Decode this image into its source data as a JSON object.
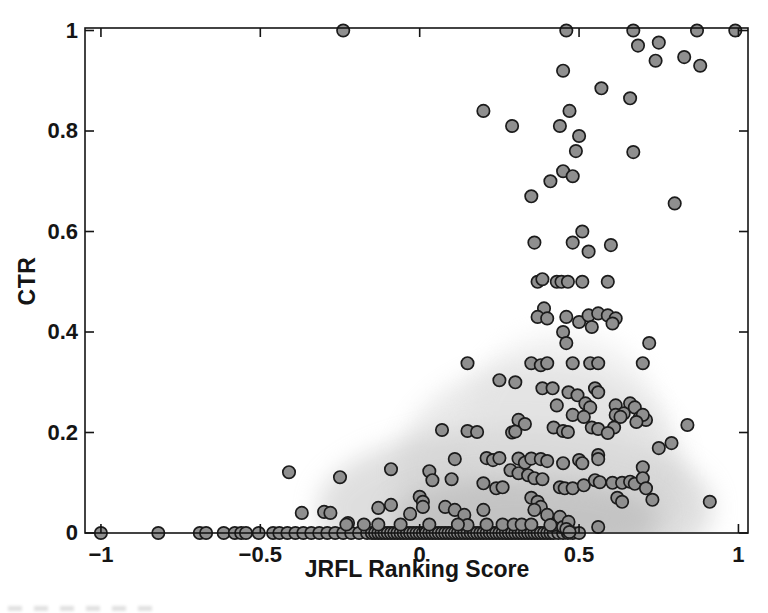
{
  "chart_data": {
    "type": "scatter",
    "title": "",
    "xlabel": "JRFL Ranking Score",
    "ylabel": "CTR",
    "xlim": [
      -1.05,
      1.03
    ],
    "ylim": [
      0,
      1.005
    ],
    "grid": false,
    "x_ticks": [
      -1,
      -0.5,
      0,
      0.5,
      1
    ],
    "x_tick_labels": [
      "−1",
      "−0.5",
      "0",
      "0.5",
      "1"
    ],
    "y_ticks": [
      0,
      0.2,
      0.4,
      0.6,
      0.8,
      1
    ],
    "y_tick_labels": [
      "0",
      "0.2",
      "0.4",
      "0.6",
      "0.8",
      "1"
    ],
    "marker": {
      "shape": "circle",
      "fill": "#8f8f8f",
      "edge": "#1b1b1b",
      "radius_px": 6.2
    },
    "axis_color": "#141414",
    "background_cloud": [
      {
        "cx": 0.3,
        "cy": 0.05,
        "rx": 0.62,
        "ry": 0.16,
        "color": "#bfbfbf",
        "opacity": 0.5
      },
      {
        "cx": 0.38,
        "cy": 0.12,
        "rx": 0.45,
        "ry": 0.22,
        "color": "#cfcfcf",
        "opacity": 0.45
      },
      {
        "cx": 0.45,
        "cy": 0.22,
        "rx": 0.3,
        "ry": 0.18,
        "color": "#dedede",
        "opacity": 0.4
      },
      {
        "cx": 0.33,
        "cy": 0.03,
        "rx": 0.42,
        "ry": 0.08,
        "color": "#b0b0b0",
        "opacity": 0.5
      }
    ],
    "points": [
      [
        -0.24,
        1
      ],
      [
        0.46,
        1
      ],
      [
        0.67,
        1
      ],
      [
        0.87,
        1
      ],
      [
        0.99,
        1
      ],
      [
        0.685,
        0.97
      ],
      [
        0.75,
        0.976
      ],
      [
        0.74,
        0.94
      ],
      [
        0.83,
        0.947
      ],
      [
        0.88,
        0.93
      ],
      [
        0.45,
        0.92
      ],
      [
        0.57,
        0.885
      ],
      [
        0.66,
        0.865
      ],
      [
        0.2,
        0.84
      ],
      [
        0.47,
        0.84
      ],
      [
        0.29,
        0.81
      ],
      [
        0.44,
        0.81
      ],
      [
        0.5,
        0.79
      ],
      [
        0.49,
        0.76
      ],
      [
        0.67,
        0.758
      ],
      [
        0.45,
        0.72
      ],
      [
        0.48,
        0.71
      ],
      [
        0.41,
        0.7
      ],
      [
        0.35,
        0.67
      ],
      [
        0.8,
        0.656
      ],
      [
        0.51,
        0.6
      ],
      [
        0.48,
        0.578
      ],
      [
        0.6,
        0.573
      ],
      [
        0.36,
        0.578
      ],
      [
        0.53,
        0.56
      ],
      [
        0.37,
        0.5
      ],
      [
        0.385,
        0.505
      ],
      [
        0.43,
        0.5
      ],
      [
        0.445,
        0.5
      ],
      [
        0.465,
        0.5
      ],
      [
        0.51,
        0.5
      ],
      [
        0.59,
        0.5
      ],
      [
        0.39,
        0.447
      ],
      [
        0.37,
        0.43
      ],
      [
        0.4,
        0.427
      ],
      [
        0.46,
        0.43
      ],
      [
        0.5,
        0.42
      ],
      [
        0.53,
        0.433
      ],
      [
        0.56,
        0.437
      ],
      [
        0.59,
        0.433
      ],
      [
        0.615,
        0.427
      ],
      [
        0.605,
        0.417
      ],
      [
        0.54,
        0.41
      ],
      [
        0.45,
        0.4
      ],
      [
        0.46,
        0.378
      ],
      [
        0.72,
        0.378
      ],
      [
        0.15,
        0.338
      ],
      [
        0.35,
        0.338
      ],
      [
        0.38,
        0.334
      ],
      [
        0.4,
        0.338
      ],
      [
        0.48,
        0.338
      ],
      [
        0.535,
        0.338
      ],
      [
        0.56,
        0.338
      ],
      [
        0.7,
        0.338
      ],
      [
        0.25,
        0.304
      ],
      [
        0.3,
        0.3
      ],
      [
        0.385,
        0.288
      ],
      [
        0.417,
        0.288
      ],
      [
        0.467,
        0.28
      ],
      [
        0.495,
        0.274
      ],
      [
        0.55,
        0.288
      ],
      [
        0.56,
        0.28
      ],
      [
        0.43,
        0.254
      ],
      [
        0.52,
        0.258
      ],
      [
        0.535,
        0.25
      ],
      [
        0.615,
        0.254
      ],
      [
        0.66,
        0.258
      ],
      [
        0.675,
        0.25
      ],
      [
        0.64,
        0.238
      ],
      [
        0.48,
        0.235
      ],
      [
        0.515,
        0.231
      ],
      [
        0.615,
        0.235
      ],
      [
        0.63,
        0.231
      ],
      [
        0.69,
        0.229
      ],
      [
        0.71,
        0.225
      ],
      [
        0.7,
        0.235
      ],
      [
        0.31,
        0.225
      ],
      [
        0.33,
        0.217
      ],
      [
        0.68,
        0.221
      ],
      [
        0.07,
        0.205
      ],
      [
        0.15,
        0.203
      ],
      [
        0.18,
        0.201
      ],
      [
        0.29,
        0.2
      ],
      [
        0.3,
        0.202
      ],
      [
        0.42,
        0.21
      ],
      [
        0.45,
        0.203
      ],
      [
        0.465,
        0.201
      ],
      [
        0.54,
        0.21
      ],
      [
        0.56,
        0.207
      ],
      [
        0.61,
        0.21
      ],
      [
        0.59,
        0.199
      ],
      [
        0.84,
        0.215
      ],
      [
        0.79,
        0.179
      ],
      [
        0.75,
        0.169
      ],
      [
        0.56,
        0.155
      ],
      [
        0.11,
        0.147
      ],
      [
        0.21,
        0.149
      ],
      [
        0.23,
        0.145
      ],
      [
        0.25,
        0.149
      ],
      [
        0.31,
        0.148
      ],
      [
        0.33,
        0.14
      ],
      [
        0.35,
        0.148
      ],
      [
        0.38,
        0.147
      ],
      [
        0.4,
        0.143
      ],
      [
        0.45,
        0.139
      ],
      [
        0.5,
        0.145
      ],
      [
        0.51,
        0.139
      ],
      [
        0.56,
        0.147
      ],
      [
        -0.41,
        0.121
      ],
      [
        -0.25,
        0.111
      ],
      [
        -0.09,
        0.127
      ],
      [
        0.03,
        0.123
      ],
      [
        0.285,
        0.125
      ],
      [
        0.31,
        0.119
      ],
      [
        0.34,
        0.115
      ],
      [
        0.36,
        0.109
      ],
      [
        0.385,
        0.107
      ],
      [
        0.7,
        0.131
      ],
      [
        0.04,
        0.105
      ],
      [
        0.1,
        0.107
      ],
      [
        0.2,
        0.099
      ],
      [
        0.24,
        0.089
      ],
      [
        0.26,
        0.091
      ],
      [
        0.44,
        0.091
      ],
      [
        0.455,
        0.089
      ],
      [
        0.48,
        0.089
      ],
      [
        0.515,
        0.095
      ],
      [
        0.55,
        0.105
      ],
      [
        0.565,
        0.101
      ],
      [
        0.605,
        0.1
      ],
      [
        0.635,
        0.1
      ],
      [
        0.66,
        0.102
      ],
      [
        0.675,
        0.098
      ],
      [
        0.7,
        0.109
      ],
      [
        0.71,
        0.089
      ],
      [
        0.91,
        0.062
      ],
      [
        0,
        0.072
      ],
      [
        0.01,
        0.062
      ],
      [
        0.01,
        0.052
      ],
      [
        0.35,
        0.07
      ],
      [
        0.37,
        0.062
      ],
      [
        0.38,
        0.052
      ],
      [
        0.36,
        0.046
      ],
      [
        0.62,
        0.07
      ],
      [
        0.635,
        0.062
      ],
      [
        0.73,
        0.066
      ],
      [
        -0.37,
        0.04
      ],
      [
        -0.3,
        0.042
      ],
      [
        -0.28,
        0.04
      ],
      [
        -0.13,
        0.05
      ],
      [
        -0.09,
        0.056
      ],
      [
        -0.03,
        0.038
      ],
      [
        0.08,
        0.052
      ],
      [
        0.11,
        0.046
      ],
      [
        0.14,
        0.036
      ],
      [
        0.2,
        0.046
      ],
      [
        0.4,
        0.036
      ],
      [
        0.42,
        0.016
      ],
      [
        0.44,
        0.032
      ],
      [
        0.45,
        0.012
      ],
      [
        0.467,
        0.022
      ],
      [
        0.56,
        0.012
      ],
      [
        -0.225,
        0.02
      ],
      [
        0.41,
        0.016
      ],
      [
        0.46,
        0.008
      ],
      [
        0.47,
        0.002
      ],
      [
        0.15,
        0.016
      ],
      [
        -0.23,
        0.017
      ],
      [
        -0.175,
        0.017
      ],
      [
        -0.13,
        0.017
      ],
      [
        -0.06,
        0.017
      ],
      [
        0.03,
        0.017
      ],
      [
        0.12,
        0.017
      ],
      [
        0.21,
        0.017
      ],
      [
        0.26,
        0.017
      ],
      [
        0.295,
        0.017
      ],
      [
        0.32,
        0.017
      ],
      [
        0.35,
        0.017
      ]
    ],
    "baseline_x": [
      -1,
      -0.82,
      -0.69,
      -0.67,
      -0.615,
      -0.58,
      -0.56,
      -0.545,
      -0.505,
      -0.46,
      -0.44,
      -0.415,
      -0.39,
      -0.365,
      -0.34,
      -0.315,
      -0.29,
      -0.265,
      -0.24,
      -0.215,
      -0.19,
      -0.165,
      -0.15,
      -0.14,
      -0.13,
      -0.12,
      -0.11,
      -0.1,
      -0.09,
      -0.08,
      -0.07,
      -0.06,
      -0.05,
      -0.04,
      -0.03,
      -0.02,
      -0.01,
      0,
      0.01,
      0.02,
      0.03,
      0.04,
      0.05,
      0.06,
      0.07,
      0.08,
      0.09,
      0.1,
      0.11,
      0.12,
      0.13,
      0.14,
      0.15,
      0.16,
      0.17,
      0.18,
      0.19,
      0.2,
      0.21,
      0.22,
      0.23,
      0.24,
      0.25,
      0.26,
      0.27,
      0.28,
      0.29,
      0.3,
      0.31,
      0.32,
      0.33,
      0.34,
      0.35,
      0.36,
      0.37,
      0.38,
      0.39,
      0.4,
      0.41,
      0.42,
      0.435,
      0.45,
      0.465,
      0.48,
      0.5
    ]
  }
}
